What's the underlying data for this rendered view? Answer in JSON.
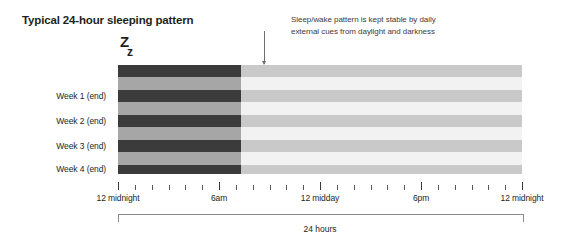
{
  "title": "Typical 24-hour sleeping pattern",
  "annotation": {
    "line1": "Sleep/wake pattern is kept stable by daily",
    "line2": "external cues from daylight and darkness"
  },
  "sleep_symbol": {
    "big": "Z",
    "small": "z"
  },
  "week_labels": [
    "Week 1 (end)",
    "Week 2 (end)",
    "Week 3 (end)",
    "Week 4 (end)"
  ],
  "axis": {
    "labels": [
      "12 midnight",
      "6am",
      "12 midday",
      "6pm",
      "12 midnight"
    ],
    "span_label": "24 hours"
  },
  "colors": {
    "night_sleep": "#3b3b3b",
    "night_awake": "#a6a6a6",
    "day_sleep": "#c9c9c9",
    "day_awake": "#f2f2f2",
    "text": "#231f20",
    "tick": "#58595b"
  },
  "chart_data": {
    "type": "heatmap",
    "title": "Typical 24-hour sleeping pattern",
    "xlabel": "24 hours",
    "ylabel": "",
    "xlim": [
      0,
      24
    ],
    "x_tick_values": [
      0,
      6,
      12,
      18,
      24
    ],
    "x_tick_labels": [
      "12 midnight",
      "6am",
      "12 midday",
      "6pm",
      "12 midnight"
    ],
    "minor_tick_interval_hours": 1,
    "grid": false,
    "legend": "none",
    "darkness_end_hour": 7.3,
    "darkness_start_hour": 0,
    "annotation": "Sleep/wake pattern is kept stable by daily external cues from daylight and darkness",
    "rows": [
      {
        "label": "",
        "state": "sleep",
        "top_pct": 0,
        "height_pct": 11.0
      },
      {
        "label": "",
        "state": "awake",
        "top_pct": 11.0,
        "height_pct": 11.9
      },
      {
        "label": "Week 1 (end)",
        "state": "sleep",
        "top_pct": 22.9,
        "height_pct": 11.0
      },
      {
        "label": "",
        "state": "awake",
        "top_pct": 33.9,
        "height_pct": 11.9
      },
      {
        "label": "Week 2 (end)",
        "state": "sleep",
        "top_pct": 45.8,
        "height_pct": 11.0
      },
      {
        "label": "",
        "state": "awake",
        "top_pct": 56.8,
        "height_pct": 11.9
      },
      {
        "label": "Week 3 (end)",
        "state": "sleep",
        "top_pct": 68.7,
        "height_pct": 11.0
      },
      {
        "label": "",
        "state": "awake",
        "top_pct": 79.7,
        "height_pct": 11.9
      },
      {
        "label": "Week 4 (end)",
        "state": "sleep",
        "top_pct": 91.6,
        "height_pct": 8.4
      }
    ]
  }
}
